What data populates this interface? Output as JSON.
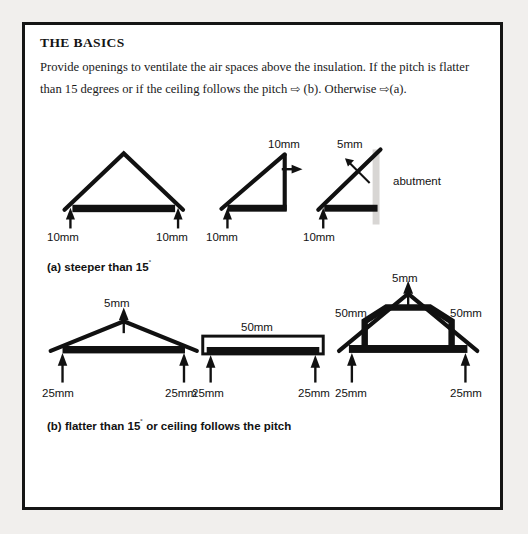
{
  "page": {
    "background_color": "#f1efed",
    "panel_background": "#ffffff",
    "panel_border_color": "#151515"
  },
  "header": {
    "title": "THE BASICS",
    "body_part1": "Provide openings to ventilate the air spaces above the insulation. If the pitch is flatter than 15 degrees or if the ceiling follows the pitch ",
    "arrow1": "⇨",
    "body_part2": " (b). Otherwise ",
    "arrow2": "⇨",
    "body_part3": "(a)."
  },
  "captions": {
    "a": "(a) steeper than 15",
    "a_degree": "˚",
    "b": "(b) flatter than 15",
    "b_degree": "˚",
    "b_tail": " or ceiling follows the pitch"
  },
  "row_a": {
    "label": "steeper than 15 degrees",
    "diagrams": [
      {
        "name": "gable-roof",
        "labels": [
          {
            "text": "10mm",
            "position": "left-eave"
          },
          {
            "text": "10mm",
            "position": "right-eave"
          }
        ]
      },
      {
        "name": "mono-pitch-roof",
        "labels": [
          {
            "text": "10mm",
            "position": "left-eave"
          },
          {
            "text": "10mm",
            "position": "high-point"
          }
        ]
      },
      {
        "name": "abutment-roof",
        "labels": [
          {
            "text": "10mm",
            "position": "left-eave"
          },
          {
            "text": "5mm",
            "position": "abutment-gap"
          },
          {
            "text": "abutment",
            "position": "wall-right"
          }
        ]
      }
    ]
  },
  "row_b": {
    "label": "flatter than 15 degrees or ceiling follows the pitch",
    "diagrams": [
      {
        "name": "shallow-gable-roof",
        "labels": [
          {
            "text": "5mm",
            "position": "ridge"
          },
          {
            "text": "25mm",
            "position": "left-eave"
          },
          {
            "text": "25mm",
            "position": "right-eave"
          }
        ]
      },
      {
        "name": "flat-roof",
        "labels": [
          {
            "text": "50mm",
            "position": "air-gap"
          },
          {
            "text": "25mm",
            "position": "left-end"
          },
          {
            "text": "25mm",
            "position": "right-end"
          }
        ]
      },
      {
        "name": "room-in-roof",
        "labels": [
          {
            "text": "5mm",
            "position": "ridge"
          },
          {
            "text": "50mm",
            "position": "left-slope"
          },
          {
            "text": "50mm",
            "position": "right-slope"
          },
          {
            "text": "25mm",
            "position": "left-eave"
          },
          {
            "text": "25mm",
            "position": "right-eave"
          }
        ]
      }
    ]
  },
  "colors": {
    "ink": "#111111",
    "abutment_wall": "#d8d6d4"
  }
}
